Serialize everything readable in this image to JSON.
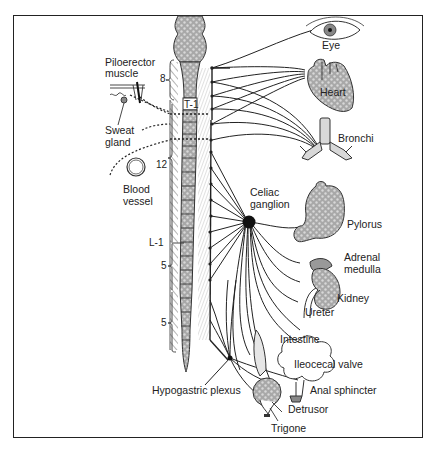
{
  "figure": {
    "colors": {
      "line": "#2a2a2a",
      "organ_fill": "#a9a9a9",
      "organ_light": "#d4d4d4",
      "ganglion": "#111111",
      "frame": "#222222"
    }
  },
  "spinal_labels": {
    "cervical_8": "8",
    "t1": "T-1",
    "thoracic_12": "12",
    "l1": "L-1",
    "lumbar_5": "5",
    "sacral_5": "5"
  },
  "left_targets": {
    "piloerector": "Piloerector",
    "piloerector_2": "muscle",
    "sweat": "Sweat",
    "sweat_2": "gland",
    "blood": "Blood",
    "blood_2": "vessel"
  },
  "ganglia": {
    "celiac": "Celiac",
    "celiac_2": "ganglion",
    "hypogastric": "Hypogastric plexus"
  },
  "organs": {
    "eye": "Eye",
    "heart": "Heart",
    "bronchi": "Bronchi",
    "pylorus": "Pylorus",
    "adrenal": "Adrenal",
    "adrenal_2": "medulla",
    "kidney": "Kidney",
    "ureter": "Ureter",
    "intestine": "Intestine",
    "ileocecal": "Ileocecal valve",
    "anal": "Anal sphincter",
    "detrusor": "Detrusor",
    "trigone": "Trigone"
  }
}
